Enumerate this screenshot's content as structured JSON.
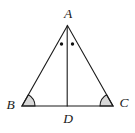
{
  "figure": {
    "type": "geometry-diagram",
    "labels": {
      "A": "A",
      "B": "B",
      "C": "C",
      "D": "D"
    },
    "marks": {
      "apex_equal_angle_dots": 2,
      "base_equal_angle_sectors": [
        "B",
        "C"
      ]
    },
    "colors": {
      "line": "#1b1b1b",
      "angle_fill": "#d8d8d8",
      "dot": "#111111",
      "label": "#1b1b1b",
      "background": "#ffffff"
    }
  }
}
